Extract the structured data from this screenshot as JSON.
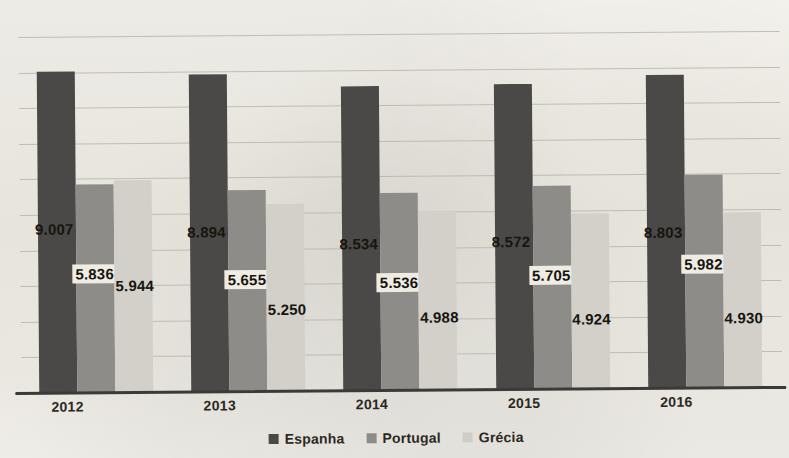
{
  "chart_data": {
    "type": "bar",
    "title": "",
    "xlabel": "",
    "ylabel": "",
    "categories": [
      "2012",
      "2013",
      "2014",
      "2015",
      "2016"
    ],
    "series": [
      {
        "name": "Espanha",
        "color": "#4b4947",
        "values": [
          9007,
          8894,
          8534,
          8572,
          8803
        ],
        "labels": [
          "9.007",
          "8.894",
          "8.534",
          "8.572",
          "8.803"
        ]
      },
      {
        "name": "Portugal",
        "color": "#8d8c88",
        "values": [
          5836,
          5655,
          5536,
          5705,
          5982
        ],
        "labels": [
          "5.836",
          "5.655",
          "5.536",
          "5.705",
          "5.982"
        ]
      },
      {
        "name": "Grécia",
        "color": "#d2d0c9",
        "values": [
          5944,
          5250,
          4988,
          4924,
          4930
        ],
        "labels": [
          "5.944",
          "5.250",
          "4.988",
          "4.924",
          "4.930"
        ]
      }
    ],
    "ylim": [
      0,
      10000
    ],
    "gridlines": [
      10000,
      9000,
      8000,
      7000,
      6000,
      5000,
      4000,
      3000,
      2000,
      1000
    ],
    "grid": true,
    "legend_position": "bottom"
  },
  "legend": {
    "items": [
      {
        "label": "Espanha",
        "color": "#4b4947"
      },
      {
        "label": "Portugal",
        "color": "#8d8c88"
      },
      {
        "label": "Grécia",
        "color": "#cfcdc6"
      }
    ]
  },
  "axis": {
    "years": [
      "2012",
      "2013",
      "2014",
      "2015",
      "2016"
    ]
  }
}
